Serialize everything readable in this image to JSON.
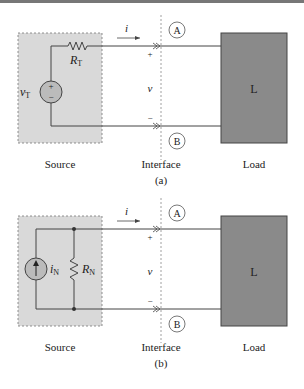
{
  "figure_a": {
    "source_label": "Source",
    "interface_label": "Interface",
    "load_label": "Load",
    "caption": "(a)",
    "load_box": "L",
    "current": "i",
    "voltage": "v",
    "plus": "+",
    "minus": "−",
    "terminal_top": "A",
    "terminal_bottom": "B",
    "resistor": "R",
    "resistor_sub": "T",
    "source_sym": "v",
    "source_sub": "T"
  },
  "figure_b": {
    "source_label": "Source",
    "interface_label": "Interface",
    "load_label": "Load",
    "caption": "(b)",
    "load_box": "L",
    "current": "i",
    "voltage": "v",
    "plus": "+",
    "minus": "−",
    "terminal_top": "A",
    "terminal_bottom": "B",
    "resistor": "R",
    "resistor_sub": "N",
    "source_sym": "i",
    "source_sub": "N"
  },
  "colors": {
    "source_fill": "#d9d9d9",
    "load_fill": "#8a8a8a",
    "wire": "#444444"
  }
}
